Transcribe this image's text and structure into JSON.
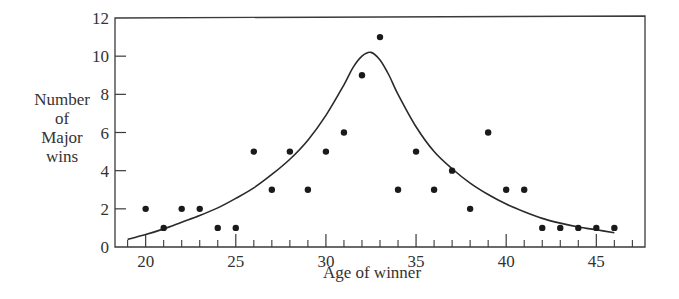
{
  "chart_data": {
    "type": "scatter",
    "title": "",
    "xlabel": "Age of winner",
    "ylabel_lines": [
      "Number",
      "of",
      "Major",
      "wins"
    ],
    "ylabel": "Number of Major wins",
    "xlim": [
      18.3,
      47.7
    ],
    "ylim": [
      0,
      12
    ],
    "x_ticks_major": [
      20,
      25,
      30,
      35,
      40,
      45
    ],
    "x_ticks_minor": [
      19,
      21,
      22,
      23,
      24,
      26,
      27,
      28,
      29,
      31,
      32,
      33,
      34,
      36,
      37,
      38,
      39,
      41,
      42,
      43,
      44,
      46,
      47
    ],
    "y_ticks": [
      0,
      2,
      4,
      6,
      8,
      10,
      12
    ],
    "grid": false,
    "legend": null,
    "series": [
      {
        "name": "Major wins by age",
        "kind": "scatter",
        "x": [
          20,
          21,
          22,
          23,
          24,
          25,
          26,
          27,
          28,
          29,
          30,
          31,
          32,
          33,
          34,
          35,
          36,
          37,
          38,
          39,
          40,
          41,
          42,
          43,
          44,
          45,
          46
        ],
        "y": [
          2,
          1,
          2,
          2,
          1,
          1,
          5,
          3,
          5,
          3,
          5,
          6,
          9,
          11,
          3,
          5,
          3,
          4,
          2,
          6,
          3,
          3,
          1,
          1,
          1,
          1,
          1
        ]
      },
      {
        "name": "Fitted curve",
        "kind": "line",
        "x": [
          19,
          20,
          21,
          22,
          23,
          24,
          25,
          26,
          27,
          28,
          29,
          30,
          31,
          31.5,
          32,
          32.5,
          33,
          33.5,
          34,
          35,
          36,
          37,
          38,
          39,
          40,
          41,
          42,
          43,
          44,
          45,
          46
        ],
        "y": [
          0.4,
          0.65,
          0.95,
          1.3,
          1.65,
          2.05,
          2.55,
          3.1,
          3.8,
          4.6,
          5.6,
          6.9,
          8.5,
          9.4,
          10.0,
          10.2,
          9.8,
          9.0,
          8.0,
          6.3,
          5.0,
          4.1,
          3.35,
          2.75,
          2.25,
          1.85,
          1.5,
          1.25,
          1.05,
          0.9,
          0.75
        ]
      }
    ]
  }
}
